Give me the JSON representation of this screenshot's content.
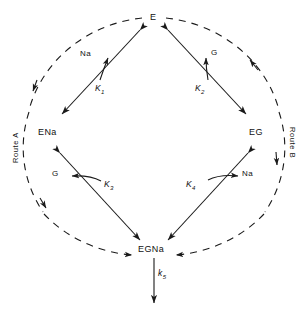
{
  "diagram": {
    "type": "kinetic-scheme",
    "nodes": [
      {
        "id": "E",
        "label": "E",
        "position": "top"
      },
      {
        "id": "ENa",
        "label": "ENa",
        "position": "left"
      },
      {
        "id": "EG",
        "label": "EG",
        "position": "right"
      },
      {
        "id": "EGNa",
        "label": "EGNa",
        "position": "bottom"
      }
    ],
    "edges": [
      {
        "from": "E",
        "to": "ENa",
        "constant": "K",
        "subscript": "1",
        "ligand": "Na",
        "ligand_arrow": "up",
        "style": "double-headed"
      },
      {
        "from": "E",
        "to": "EG",
        "constant": "K",
        "subscript": "2",
        "ligand": "G",
        "ligand_arrow": "up",
        "style": "double-headed"
      },
      {
        "from": "ENa",
        "to": "EGNa",
        "constant": "K",
        "subscript": "3",
        "ligand": "G",
        "ligand_arrow": "left",
        "style": "double-headed"
      },
      {
        "from": "EG",
        "to": "EGNa",
        "constant": "K",
        "subscript": "4",
        "ligand": "Na",
        "ligand_arrow": "right",
        "style": "double-headed"
      },
      {
        "from": "EGNa",
        "to": "",
        "constant": "k",
        "subscript": "5",
        "ligand": "",
        "ligand_arrow": "down",
        "style": "single-headed"
      }
    ],
    "rate_labels": [
      {
        "text": "K",
        "sub": "1"
      },
      {
        "text": "K",
        "sub": "2"
      },
      {
        "text": "K",
        "sub": "3"
      },
      {
        "text": "K",
        "sub": "4"
      },
      {
        "text": "k",
        "sub": "5"
      }
    ],
    "ligands": [
      {
        "name": "Na",
        "at": "upper-left"
      },
      {
        "name": "G",
        "at": "upper-right"
      },
      {
        "name": "G",
        "at": "lower-left"
      },
      {
        "name": "Na",
        "at": "lower-right"
      }
    ],
    "routes": [
      {
        "id": "A",
        "label": "Route A",
        "side": "left",
        "direction": "E to EGNa"
      },
      {
        "id": "B",
        "label": "Route B",
        "side": "right",
        "direction": "E to EGNa"
      }
    ],
    "colors": {
      "line": "#1a1a1a",
      "text": "#111111",
      "background": "#ffffff"
    }
  }
}
